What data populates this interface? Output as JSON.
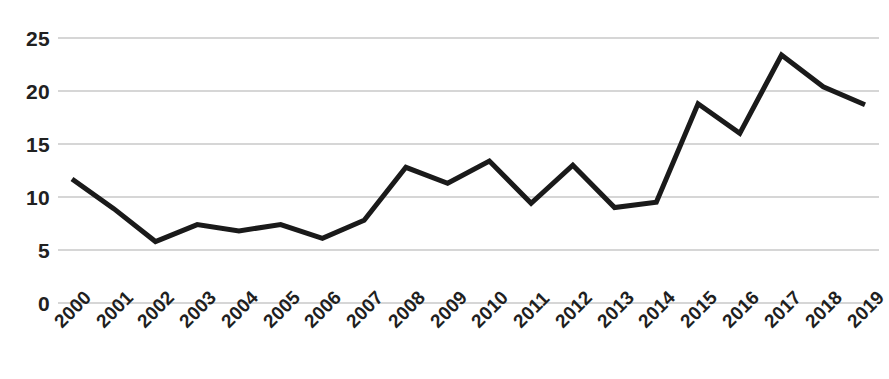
{
  "chart_data": {
    "type": "line",
    "title": "",
    "subtitle": "",
    "xlabel": "",
    "ylabel": "",
    "categories": [
      "2000",
      "2001",
      "2002",
      "2003",
      "2004",
      "2005",
      "2006",
      "2007",
      "2008",
      "2009",
      "2010",
      "2011",
      "2012",
      "2013",
      "2014",
      "2015",
      "2016",
      "2017",
      "2018",
      "2019"
    ],
    "values": [
      11.7,
      8.9,
      5.8,
      7.4,
      6.8,
      7.4,
      6.1,
      7.8,
      12.8,
      11.3,
      13.4,
      9.4,
      13.0,
      9.0,
      9.5,
      18.8,
      16.0,
      23.4,
      20.4,
      18.7
    ],
    "series": [
      {
        "name": "series-1",
        "color": "#1a1a1a",
        "line_width": 5,
        "values": [
          11.7,
          8.9,
          5.8,
          7.4,
          6.8,
          7.4,
          6.1,
          7.8,
          12.8,
          11.3,
          13.4,
          9.4,
          13.0,
          9.0,
          9.5,
          18.8,
          16.0,
          23.4,
          20.4,
          18.7
        ]
      }
    ],
    "ylim": [
      0,
      25
    ],
    "y_ticks": [
      0,
      5,
      10,
      15,
      20,
      25
    ],
    "y_tick_labels": [
      "0",
      "5",
      "10",
      "15",
      "20",
      "25"
    ],
    "x_tick_labels": [
      "2000",
      "2001",
      "2002",
      "2003",
      "2004",
      "2005",
      "2006",
      "2007",
      "2008",
      "2009",
      "2010",
      "2011",
      "2012",
      "2013",
      "2014",
      "2015",
      "2016",
      "2017",
      "2018",
      "2019"
    ],
    "x_tick_rotation_deg": -45,
    "grid": {
      "horizontal": true,
      "vertical": false,
      "color": "#c9c9c9"
    },
    "legend": {
      "visible": false,
      "position": "none",
      "entries": []
    },
    "background_color": "#ffffff",
    "axis_label_color": "#212121"
  }
}
